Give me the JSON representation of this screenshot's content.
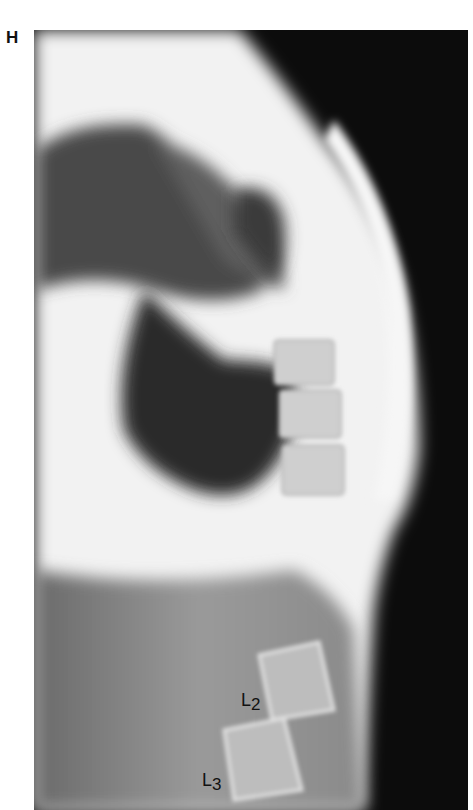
{
  "figure": {
    "panel_label": "H",
    "image_description": "Lateral radiograph of the thoracolumbar spine",
    "vertebra_labels": [
      {
        "base": "L",
        "sub": "2"
      },
      {
        "base": "L",
        "sub": "3"
      }
    ],
    "colors": {
      "background": "#ffffff",
      "film_dark": "#0c0c0c",
      "bone_light": "#f4f4f4",
      "label_text": "#111111"
    }
  }
}
